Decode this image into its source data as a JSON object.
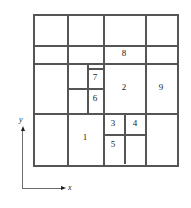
{
  "figure": {
    "line_color": "#555555",
    "axis_color": "#6b6b6b",
    "text_color": "#1a1a1a",
    "background": "#ffffff"
  },
  "axes": {
    "x_label": "x",
    "y_label": "y",
    "origin": {
      "x": 22,
      "y": 188
    },
    "x_arrow_icon": "arrow-right-icon",
    "y_arrow_icon": "arrow-up-icon"
  },
  "grid": {
    "outer_bounds": {
      "left": 33,
      "top": 14,
      "right": 177,
      "bottom": 165
    },
    "horizontal_lines": [
      {
        "y": 14,
        "x1": 33,
        "x2": 177
      },
      {
        "y": 45,
        "x1": 33,
        "x2": 177
      },
      {
        "y": 63,
        "x1": 33,
        "x2": 177
      },
      {
        "y": 45,
        "x1": 103,
        "x2": 145
      },
      {
        "y": 68,
        "x1": 87,
        "x2": 103
      },
      {
        "y": 88,
        "x1": 67,
        "x2": 103
      },
      {
        "y": 113,
        "x1": 33,
        "x2": 177
      },
      {
        "y": 134,
        "x1": 103,
        "x2": 145
      },
      {
        "y": 165,
        "x1": 33,
        "x2": 177
      }
    ],
    "vertical_lines": [
      {
        "x": 33,
        "y1": 14,
        "y2": 165
      },
      {
        "x": 67,
        "y1": 14,
        "y2": 165
      },
      {
        "x": 87,
        "y1": 63,
        "y2": 113
      },
      {
        "x": 103,
        "y1": 14,
        "y2": 165
      },
      {
        "x": 124,
        "y1": 113,
        "y2": 162
      },
      {
        "x": 145,
        "y1": 14,
        "y2": 165
      },
      {
        "x": 177,
        "y1": 14,
        "y2": 165
      }
    ]
  },
  "regions": [
    {
      "id": "1",
      "label": "1",
      "cx": 85,
      "cy": 138,
      "bounds": {
        "left": 67,
        "top": 113,
        "right": 103,
        "bottom": 165
      }
    },
    {
      "id": "2",
      "label": "2",
      "cx": 124,
      "cy": 88,
      "bounds": {
        "left": 103,
        "top": 63,
        "right": 145,
        "bottom": 113
      }
    },
    {
      "id": "3",
      "label": "3",
      "cx": 113,
      "cy": 124,
      "bounds": {
        "left": 103,
        "top": 113,
        "right": 124,
        "bottom": 134
      }
    },
    {
      "id": "4",
      "label": "4",
      "cx": 135,
      "cy": 124,
      "bounds": {
        "left": 124,
        "top": 113,
        "right": 145,
        "bottom": 134
      }
    },
    {
      "id": "5",
      "label": "5",
      "cx": 113,
      "cy": 145,
      "bounds": {
        "left": 103,
        "top": 134,
        "right": 124,
        "bottom": 165
      }
    },
    {
      "id": "6",
      "label": "6",
      "cx": 95,
      "cy": 99,
      "bounds": {
        "left": 87,
        "top": 88,
        "right": 103,
        "bottom": 113
      }
    },
    {
      "id": "7",
      "label": "7",
      "cx": 95,
      "cy": 78,
      "bounds": {
        "left": 87,
        "top": 68,
        "right": 103,
        "bottom": 88
      }
    },
    {
      "id": "8",
      "label": "8",
      "cx": 124,
      "cy": 54,
      "bounds": {
        "left": 103,
        "top": 45,
        "right": 145,
        "bottom": 63
      }
    },
    {
      "id": "9",
      "label": "9",
      "cx": 161,
      "cy": 88,
      "bounds": {
        "left": 145,
        "top": 63,
        "right": 177,
        "bottom": 113
      }
    }
  ]
}
